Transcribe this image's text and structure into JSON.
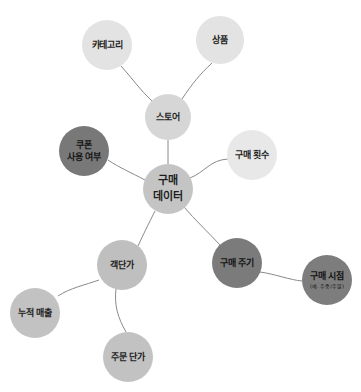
{
  "diagram": {
    "type": "mind-map",
    "center": {
      "id": "purchase-data",
      "lines": [
        "구매",
        "데이터"
      ],
      "color": "#c4c4c4",
      "x": 168,
      "y": 189,
      "r": 25
    },
    "nodes": [
      {
        "id": "category",
        "lines": [
          "카테고리"
        ],
        "color": "#e3e3e3",
        "x": 107,
        "y": 45,
        "r": 25
      },
      {
        "id": "product",
        "lines": [
          "상품"
        ],
        "color": "#e3e3e3",
        "x": 220,
        "y": 40,
        "r": 24
      },
      {
        "id": "store",
        "lines": [
          "스토어"
        ],
        "color": "#d6d6d6",
        "x": 168,
        "y": 117,
        "r": 23
      },
      {
        "id": "coupon-usage",
        "lines": [
          "쿠폰",
          "사용 여부"
        ],
        "color": "#787878",
        "x": 84,
        "y": 151,
        "r": 25
      },
      {
        "id": "purchase-count",
        "lines": [
          "구매 횟수"
        ],
        "color": "#e8e8e8",
        "x": 252,
        "y": 155,
        "r": 25
      },
      {
        "id": "avg-order-value",
        "lines": [
          "객단가"
        ],
        "color": "#bfbfbf",
        "x": 122,
        "y": 265,
        "r": 25
      },
      {
        "id": "purchase-cycle",
        "lines": [
          "구매 주기"
        ],
        "color": "#7b7b7b",
        "x": 237,
        "y": 263,
        "r": 25
      },
      {
        "id": "purchase-time",
        "lines": [
          "구매 시점"
        ],
        "sub": "(예. 주중/주말)",
        "color": "#7d7d7d",
        "x": 327,
        "y": 280,
        "r": 25
      },
      {
        "id": "cumulative-sales",
        "lines": [
          "누적 매출"
        ],
        "color": "#c2c2c2",
        "x": 35,
        "y": 313,
        "r": 25
      },
      {
        "id": "order-unit-price",
        "lines": [
          "주문 단가"
        ],
        "color": "#c2c2c2",
        "x": 128,
        "y": 357,
        "r": 25
      }
    ],
    "edges": [
      {
        "from": "purchase-data",
        "to": "store",
        "d": "M168,164 L168,140"
      },
      {
        "from": "store",
        "to": "category",
        "d": "M152,101 C140,90 132,78 121,66"
      },
      {
        "from": "store",
        "to": "product",
        "d": "M182,99 C192,84 200,74 212,63"
      },
      {
        "from": "purchase-data",
        "to": "coupon-usage",
        "d": "M145,180 C130,172 120,168 108,160"
      },
      {
        "from": "purchase-data",
        "to": "purchase-count",
        "d": "M190,178 C205,172 210,160 228,159"
      },
      {
        "from": "purchase-data",
        "to": "avg-order-value",
        "d": "M155,211 C148,225 143,235 138,246"
      },
      {
        "from": "purchase-data",
        "to": "purchase-cycle",
        "d": "M184,207 C195,220 208,232 220,245"
      },
      {
        "from": "purchase-cycle",
        "to": "purchase-time",
        "d": "M260,272 C275,274 290,280 302,281"
      },
      {
        "from": "avg-order-value",
        "to": "cumulative-sales",
        "d": "M99,280 C85,285 70,288 58,296"
      },
      {
        "from": "avg-order-value",
        "to": "order-unit-price",
        "d": "M116,289 C114,305 118,318 126,332"
      }
    ]
  }
}
